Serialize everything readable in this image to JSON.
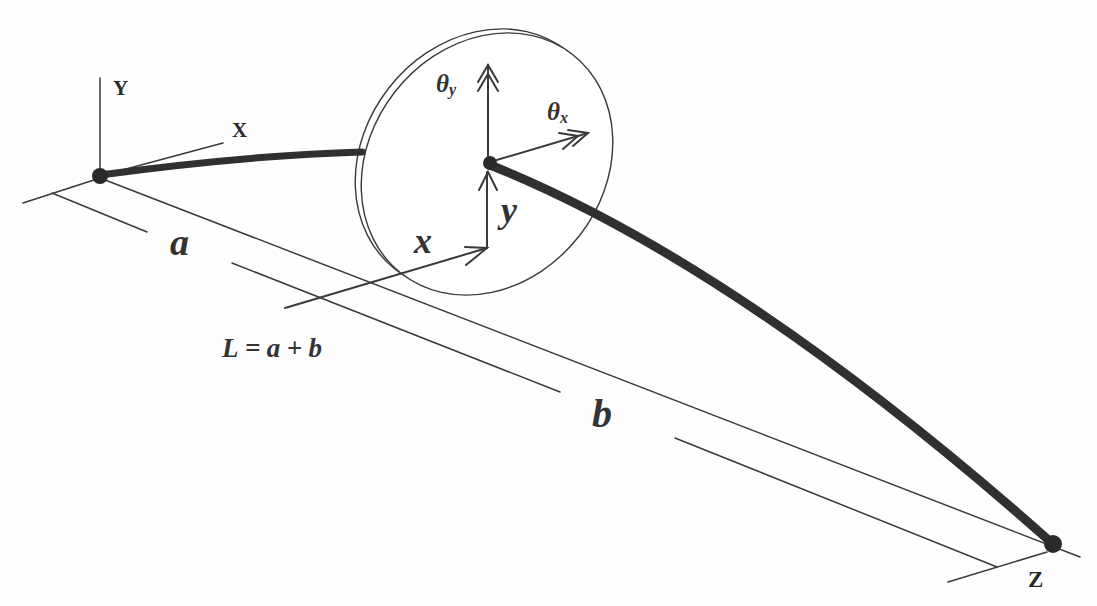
{
  "labels": {
    "global_y_axis": "Y",
    "global_x_axis": "X",
    "global_z_axis": "Z",
    "segment_a": "a",
    "segment_b": "b",
    "total_length": "L=a+b",
    "disk_x": "x",
    "disk_y": "y",
    "theta_y": {
      "symbol": "θ",
      "subscript": "y"
    },
    "theta_x": {
      "symbol": "θ",
      "subscript": "x"
    }
  },
  "colors": {
    "background": "#fefefe",
    "line": "#3a3a3a",
    "shaft": "#303030",
    "node": "#2a2a2a",
    "disk_fill": "#ffffff"
  }
}
